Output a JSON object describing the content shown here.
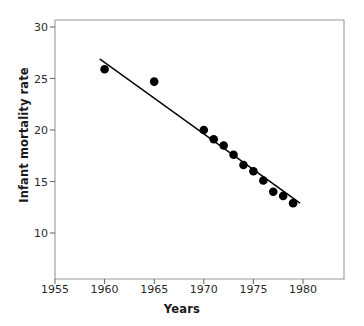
{
  "chart_data": {
    "type": "scatter",
    "title": "",
    "xlabel": "Years",
    "ylabel": "Infant mortality rate",
    "xlim": [
      1955,
      1984
    ],
    "ylim": [
      8.5,
      31
    ],
    "grid": false,
    "legend": "none",
    "xticks": [
      1955,
      1960,
      1965,
      1970,
      1975,
      1980
    ],
    "yticks": [
      10,
      15,
      20,
      25,
      30
    ],
    "x": [
      1960,
      1965,
      1970,
      1971,
      1972,
      1973,
      1974,
      1975,
      1976,
      1977,
      1978,
      1979
    ],
    "values": [
      25.9,
      24.7,
      20.0,
      19.1,
      18.5,
      17.6,
      16.6,
      16.0,
      15.1,
      14.0,
      13.6,
      12.9
    ],
    "series": [
      {
        "name": "Infant mortality rate",
        "marker": "filled-circle",
        "color": "#000000",
        "points": [
          {
            "x": 1960,
            "y": 25.9
          },
          {
            "x": 1965,
            "y": 24.7
          },
          {
            "x": 1970,
            "y": 20.0
          },
          {
            "x": 1971,
            "y": 19.1
          },
          {
            "x": 1972,
            "y": 18.5
          },
          {
            "x": 1973,
            "y": 17.6
          },
          {
            "x": 1974,
            "y": 16.6
          },
          {
            "x": 1975,
            "y": 16.0
          },
          {
            "x": 1976,
            "y": 15.1
          },
          {
            "x": 1977,
            "y": 14.0
          },
          {
            "x": 1978,
            "y": 13.6
          },
          {
            "x": 1979,
            "y": 12.9
          }
        ]
      },
      {
        "name": "trend-line",
        "type": "line",
        "color": "#000000",
        "endpoints": [
          {
            "x": 1959.5,
            "y": 26.9
          },
          {
            "x": 1979.7,
            "y": 12.9
          }
        ]
      }
    ]
  },
  "axis": {
    "x_tick_labels": [
      "1955",
      "1960",
      "1965",
      "1970",
      "1975",
      "1980"
    ],
    "y_tick_labels": [
      "30",
      "25",
      "20",
      "15",
      "10"
    ],
    "x_axis_title": "Years",
    "y_axis_title": "Infant mortality rate"
  },
  "colors": {
    "marker": "#000000",
    "line": "#000000",
    "frame": "#808080",
    "text": "#1a1a1a"
  }
}
